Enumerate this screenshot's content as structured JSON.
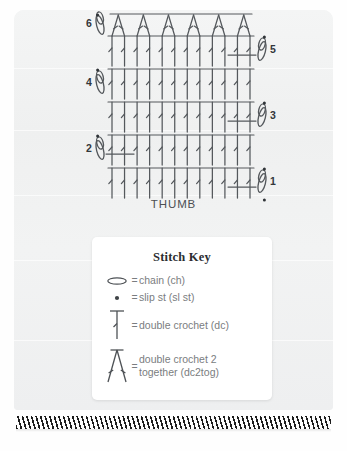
{
  "page": {
    "background_color": "#f1f2f2",
    "paper_color": "#f1f2f2"
  },
  "chart": {
    "title_label": "THUMB",
    "ink_color": "#54585c",
    "row_numbers": [
      "1",
      "2",
      "3",
      "4",
      "5",
      "6"
    ],
    "row_number_positions": [
      "right",
      "left",
      "right",
      "left",
      "right",
      "left"
    ],
    "stitches_per_row": 12,
    "rows": [
      {
        "number": "1",
        "side": "right",
        "stitch": "double crochet (dc)",
        "count": 12,
        "has_turning_chain": true,
        "has_slip_stitch": true
      },
      {
        "number": "2",
        "side": "left",
        "stitch": "double crochet (dc)",
        "count": 12,
        "has_turning_chain": true,
        "has_slip_stitch": true
      },
      {
        "number": "3",
        "side": "right",
        "stitch": "double crochet (dc)",
        "count": 12,
        "has_turning_chain": true,
        "has_slip_stitch": true
      },
      {
        "number": "4",
        "side": "left",
        "stitch": "double crochet (dc)",
        "count": 12,
        "has_turning_chain": true,
        "has_slip_stitch": true
      },
      {
        "number": "5",
        "side": "right",
        "stitch": "double crochet (dc)",
        "count": 12,
        "has_turning_chain": true,
        "has_slip_stitch": true
      },
      {
        "number": "6",
        "side": "left",
        "stitch": "double crochet 2 together (dc2tog)",
        "count": 6,
        "has_turning_chain": true,
        "has_slip_stitch": true
      }
    ]
  },
  "stitch_key": {
    "title": "Stitch Key",
    "equals": "=",
    "items": [
      {
        "symbol": "chain-oval",
        "label": "chain (ch)"
      },
      {
        "symbol": "slip-stitch-dot",
        "label": "slip st (sl st)"
      },
      {
        "symbol": "double-crochet-bar",
        "label": "double crochet (dc)"
      },
      {
        "symbol": "dc2tog-v",
        "label": "double crochet 2\ntogether (dc2tog)"
      }
    ]
  },
  "footer": {
    "hatch_color": "#1c1c1c"
  }
}
